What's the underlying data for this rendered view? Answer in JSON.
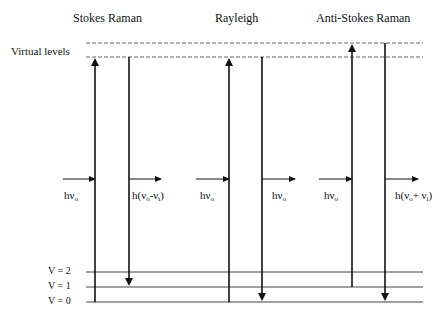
{
  "diagram": {
    "type": "energy-level diagram",
    "titles": {
      "stokes": "Stokes Raman",
      "rayleigh": "Rayleigh",
      "anti_stokes": "Anti-Stokes Raman"
    },
    "virtual_levels_label": "Virtual levels",
    "vibrational_levels": [
      "V = 2",
      "V = 1",
      "V = 0"
    ],
    "photon_labels": {
      "stokes_in": "hν",
      "stokes_in_sub": "o",
      "stokes_out_prefix": "h(ν",
      "stokes_out_sub1": "o",
      "stokes_out_mid": "-ν",
      "stokes_out_sub2": "i",
      "stokes_out_suffix": ")",
      "rayleigh_in": "hν",
      "rayleigh_in_sub": "o",
      "rayleigh_out": "hν",
      "rayleigh_out_sub": "o",
      "anti_in": "hν",
      "anti_in_sub": "o",
      "anti_out_prefix": "h(ν",
      "anti_out_sub1": "o",
      "anti_out_mid": "+ ν",
      "anti_out_sub2": "i",
      "anti_out_suffix": ")"
    },
    "colors": {
      "line": "#111111",
      "dashed": "#555555",
      "level": "#333333"
    }
  }
}
